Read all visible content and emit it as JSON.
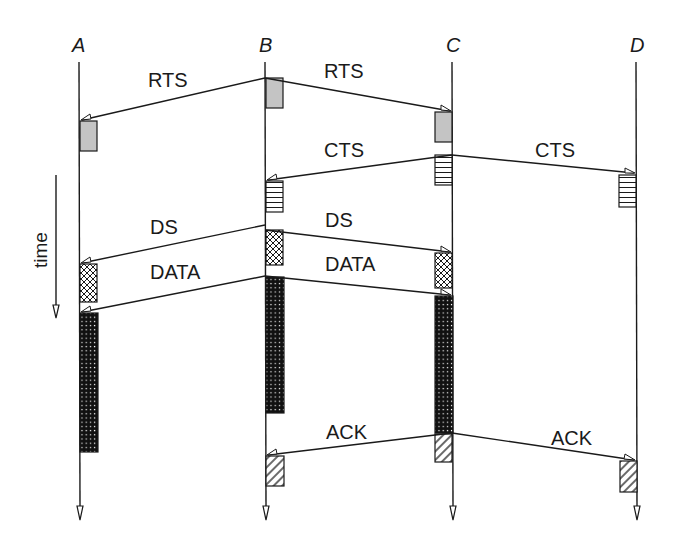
{
  "diagram": {
    "type": "sequence-timing",
    "stations": [
      {
        "id": "A",
        "label": "A",
        "x": 79
      },
      {
        "id": "B",
        "label": "B",
        "x": 265
      },
      {
        "id": "C",
        "label": "C",
        "x": 452
      },
      {
        "id": "D",
        "label": "D",
        "x": 636
      }
    ],
    "time_axis": {
      "label": "time",
      "direction": "down"
    },
    "messages": [
      {
        "id": "rts-b-a",
        "label": "RTS",
        "from": "B",
        "to": "A",
        "kind": "RTS"
      },
      {
        "id": "rts-b-c",
        "label": "RTS",
        "from": "B",
        "to": "C",
        "kind": "RTS"
      },
      {
        "id": "cts-c-b",
        "label": "CTS",
        "from": "C",
        "to": "B",
        "kind": "CTS"
      },
      {
        "id": "cts-c-d",
        "label": "CTS",
        "from": "C",
        "to": "D",
        "kind": "CTS"
      },
      {
        "id": "ds-b-a",
        "label": "DS",
        "from": "B",
        "to": "A",
        "kind": "DS"
      },
      {
        "id": "ds-b-c",
        "label": "DS",
        "from": "B",
        "to": "C",
        "kind": "DS"
      },
      {
        "id": "data-b-a",
        "label": "DATA",
        "from": "B",
        "to": "A",
        "kind": "DATA"
      },
      {
        "id": "data-b-c",
        "label": "DATA",
        "from": "B",
        "to": "C",
        "kind": "DATA"
      },
      {
        "id": "ack-c-b",
        "label": "ACK",
        "from": "C",
        "to": "B",
        "kind": "ACK"
      },
      {
        "id": "ack-c-d",
        "label": "ACK",
        "from": "C",
        "to": "D",
        "kind": "ACK"
      }
    ],
    "frame_fills": {
      "RTS": "solid-gray",
      "CTS": "horizontal-lines",
      "DS": "crosshatch",
      "DATA": "black-with-white-dots",
      "ACK": "diagonal-hatch"
    },
    "colors": {
      "ink": "#1a1a1a",
      "rts_fill": "#c4c4c4",
      "background": "#ffffff"
    }
  }
}
